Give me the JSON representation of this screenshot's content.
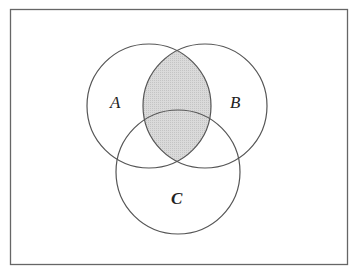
{
  "diagram": {
    "type": "venn",
    "universe": {
      "x": 10,
      "y": 9,
      "width": 338,
      "height": 256
    },
    "sets": [
      {
        "name": "A",
        "label": "A",
        "cx": 149,
        "cy": 106,
        "r": 62
      },
      {
        "name": "B",
        "label": "B",
        "cx": 205,
        "cy": 106,
        "r": 62
      },
      {
        "name": "C",
        "label": "C",
        "cx": 178,
        "cy": 172,
        "r": 62
      }
    ],
    "shaded_region": "A ∩ B",
    "colors": {
      "stroke": "#555555",
      "shade": "#d6d6d6",
      "background": "#ffffff"
    }
  }
}
